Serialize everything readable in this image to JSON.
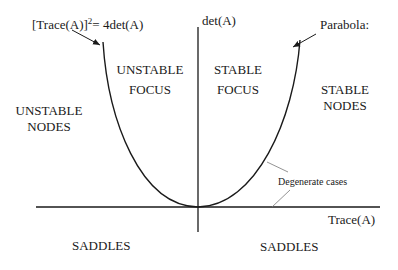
{
  "diagram": {
    "title_equation": {
      "lhs": "[Trace(A)]",
      "superscript": "2",
      "rhs": "= 4det(A)"
    },
    "axes": {
      "y_label": "det(A)",
      "x_label": "Trace(A)"
    },
    "parabola_label": "Parabola:",
    "regions": {
      "unstable_focus": [
        "UNSTABLE",
        "FOCUS"
      ],
      "stable_focus": [
        "STABLE",
        "FOCUS"
      ],
      "unstable_nodes": [
        "UNSTABLE",
        "NODES"
      ],
      "stable_nodes": [
        "STABLE",
        "NODES"
      ],
      "saddles_left": "SADDLES",
      "saddles_right": "SADDLES"
    },
    "annotation": "Degenerate cases",
    "colors": {
      "line": "#1a1a1a",
      "pointer": "#555555"
    }
  }
}
